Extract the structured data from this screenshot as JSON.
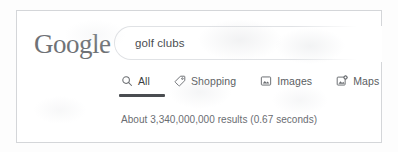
{
  "brand": {
    "logo_text": "Google",
    "logo_color": "#6f7276"
  },
  "search": {
    "query": "golf clubs",
    "placeholder": "Search",
    "icon": "search-icon"
  },
  "tabs": [
    {
      "label": "All",
      "icon": "search-icon",
      "active": true
    },
    {
      "label": "Shopping",
      "icon": "tag-icon",
      "active": false
    },
    {
      "label": "Images",
      "icon": "image-icon",
      "active": false
    },
    {
      "label": "Maps",
      "icon": "map-pin-icon",
      "active": false
    }
  ],
  "results": {
    "stats_text": "About 3,340,000,000 results (0.67 seconds)",
    "count": "3,340,000,000",
    "seconds": "0.67"
  },
  "colors": {
    "active_underline": "#4a4d51",
    "text": "#5a5d61",
    "border": "#d4d6d9",
    "page_background": "#ffffff"
  }
}
